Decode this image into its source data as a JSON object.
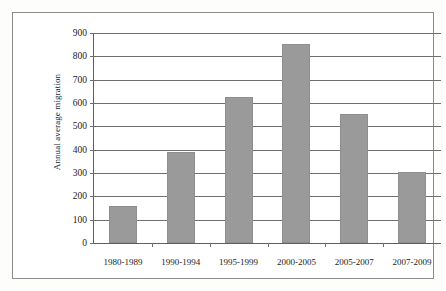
{
  "chart_data": {
    "type": "bar",
    "title": "",
    "xlabel": "",
    "ylabel": "Annual average migration",
    "categories": [
      "1980-1989",
      "1990-1994",
      "1995-1999",
      "2000-2005",
      "2005-2007",
      "2007-2009"
    ],
    "values": [
      160,
      390,
      625,
      852,
      552,
      305
    ],
    "ylim": [
      0,
      900
    ],
    "ytick_step": 100,
    "yticks": [
      0,
      100,
      200,
      300,
      400,
      500,
      600,
      700,
      800,
      900
    ],
    "ytick_labels": [
      "0",
      "100",
      "200",
      "300",
      "400",
      "500",
      "600",
      "700",
      "800",
      "900"
    ],
    "grid": true,
    "legend": false,
    "series": [
      {
        "name": "Annual average migration",
        "values": [
          160,
          390,
          625,
          852,
          552,
          305
        ],
        "color": "#9a9a9a"
      }
    ],
    "colors": {
      "bar_fill": "#9a9a9a",
      "bar_stroke": "#8e8e8e",
      "gridline": "#6f6f6f",
      "axis": "#5f5f5f",
      "frame": "#8c8c8c",
      "background": "#ffffff",
      "text": "#222222"
    }
  }
}
